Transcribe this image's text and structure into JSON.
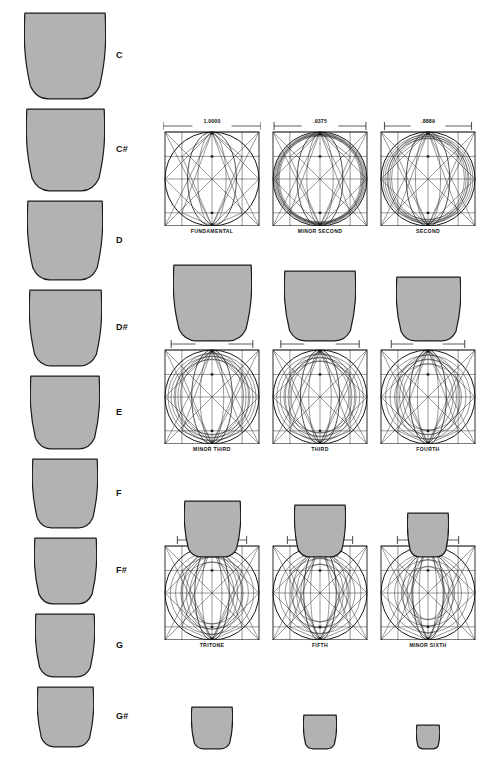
{
  "figure": {
    "type": "geometric-acoustic-diagram",
    "fill_color": "#b2b2b2",
    "stroke_color": "#1a1a1a"
  },
  "note_column": {
    "items": [
      {
        "label": "C",
        "ratio": 1.0,
        "top": 12,
        "width": 82,
        "height": 88
      },
      {
        "label": "C#",
        "ratio": 0.9375,
        "top": 108,
        "width": 79,
        "height": 84
      },
      {
        "label": "D",
        "ratio": 0.8889,
        "top": 200,
        "width": 76,
        "height": 81
      },
      {
        "label": "D#",
        "ratio": 0.8333,
        "top": 289,
        "width": 73,
        "height": 78
      },
      {
        "label": "E",
        "ratio": 0.8,
        "top": 375,
        "width": 70,
        "height": 75
      },
      {
        "label": "F",
        "ratio": 0.75,
        "top": 458,
        "width": 66,
        "height": 71
      },
      {
        "label": "F#",
        "ratio": 0.7071,
        "top": 537,
        "width": 63,
        "height": 68
      },
      {
        "label": "G",
        "ratio": 0.6667,
        "top": 613,
        "width": 60,
        "height": 65
      },
      {
        "label": "G#",
        "ratio": 0.625,
        "top": 686,
        "width": 57,
        "height": 62
      }
    ]
  },
  "panel_rows": [
    {
      "panels": [
        {
          "caption": "FUNDAMENTAL",
          "dimension": "1.0000",
          "ratio": 1.0,
          "rings": 1
        },
        {
          "caption": "MINOR SECOND",
          "dimension": ".9375",
          "ratio": 0.9375,
          "rings": 4
        },
        {
          "caption": "SECOND",
          "dimension": ".8889",
          "ratio": 0.8889,
          "rings": 4
        }
      ]
    },
    {
      "panels": [
        {
          "caption": "MINOR THIRD",
          "dimension": ".8333",
          "ratio": 0.8333,
          "rings": 4
        },
        {
          "caption": "THIRD",
          "dimension": ".8000",
          "ratio": 0.8,
          "rings": 4
        },
        {
          "caption": "FOURTH",
          "dimension": ".7500",
          "ratio": 0.75,
          "rings": 4
        }
      ]
    },
    {
      "panels": [
        {
          "caption": "TRITONE",
          "dimension": ".7071",
          "ratio": 0.7071,
          "rings": 4
        },
        {
          "caption": "FIFTH",
          "dimension": ".6667",
          "ratio": 0.6667,
          "rings": 4
        },
        {
          "caption": "MINOR SIXTH",
          "dimension": ".6250",
          "ratio": 0.625,
          "rings": 4
        }
      ]
    }
  ],
  "shape_rows": [
    {
      "shapes": [
        {
          "ratio": 0.9375,
          "width": 79,
          "height": 78
        },
        {
          "ratio": 0.8889,
          "width": 72,
          "height": 72
        },
        {
          "ratio": 0.8333,
          "width": 65,
          "height": 66
        }
      ]
    },
    {
      "shapes": [
        {
          "ratio": 0.8,
          "width": 57,
          "height": 58
        },
        {
          "ratio": 0.75,
          "width": 52,
          "height": 54
        },
        {
          "ratio": 0.7071,
          "width": 42,
          "height": 46
        }
      ]
    },
    {
      "shapes": [
        {
          "ratio": 0.6667,
          "width": 42,
          "height": 44
        },
        {
          "ratio": 0.625,
          "width": 34,
          "height": 36
        },
        {
          "ratio": 0.5833,
          "width": 24,
          "height": 26
        }
      ]
    }
  ]
}
